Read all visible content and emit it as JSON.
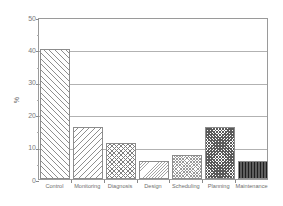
{
  "chart_data": {
    "type": "bar",
    "title": "",
    "subtitle": "",
    "xlabel": "",
    "ylabel": "%",
    "categories": [
      "Control",
      "Monitoring",
      "Diagnosis",
      "Design",
      "Scheduling",
      "Planning",
      "Maintenance"
    ],
    "values": [
      40,
      16,
      11,
      5.5,
      7.5,
      16,
      5.5
    ],
    "ylim": [
      0,
      50
    ],
    "yticks": [
      0,
      10,
      20,
      30,
      40,
      50
    ],
    "ytick_labels": [
      "0",
      "10",
      "20",
      "30",
      "40",
      "50"
    ],
    "grid": "horizontal",
    "legend": "none",
    "bar_patterns": [
      "forward-diagonal",
      "backward-diagonal",
      "crosshatch",
      "fine-diagonal",
      "dense-crosshatch",
      "dark-checker",
      "dark-vertical-lines"
    ],
    "colors": {
      "frame": "#9a9a9a",
      "gridline": "#b2b2b2",
      "tick_text": "#7a7a7a",
      "bar_edge": "#8c8c8c",
      "background": "#ffffff"
    }
  }
}
